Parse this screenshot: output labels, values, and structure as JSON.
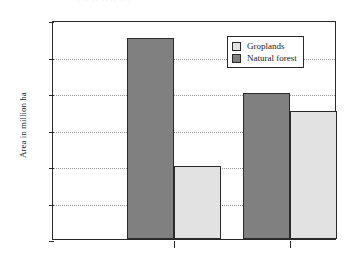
{
  "header_fragment": "··· ·· ···· ···",
  "legend": {
    "position": "top-right",
    "items": [
      {
        "label": "Groplands",
        "color": "#e2e2e2",
        "swatch": "light"
      },
      {
        "label": "Natural forest",
        "color": "#808080",
        "swatch": "dark"
      }
    ]
  },
  "axes": {
    "ylabel": "Area in million ha",
    "yticks": [
      400,
      420,
      440,
      460,
      480,
      500,
      520
    ],
    "xticks": [
      "1980",
      "1995"
    ]
  },
  "chart_data": {
    "type": "bar",
    "title": "",
    "xlabel": "",
    "ylabel": "Area in million ha",
    "categories": [
      "1980",
      "1995"
    ],
    "series": [
      {
        "name": "Natural forest",
        "color": "#808080",
        "values": [
          510,
          480
        ]
      },
      {
        "name": "Groplands",
        "color": "#e2e2e2",
        "values": [
          440,
          470
        ]
      }
    ],
    "ylim": [
      400,
      520
    ],
    "ytick_step": 20,
    "grid": true,
    "grid_axis": "y",
    "grid_style": "dotted",
    "legend_position": "top-right"
  }
}
